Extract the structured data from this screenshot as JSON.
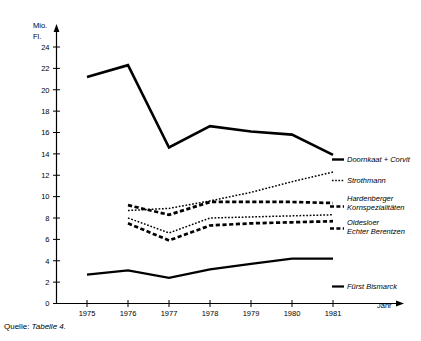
{
  "chart_data": {
    "type": "line",
    "title": "",
    "subtitle": "",
    "xlabel": "Jahr",
    "ylabel": "Mio. Fl.",
    "ylabel_line1": "Mio.",
    "ylabel_line2": "Fl.",
    "x": [
      1975,
      1976,
      1977,
      1978,
      1979,
      1980,
      1981
    ],
    "categories": [
      "1975",
      "1976",
      "1977",
      "1978",
      "1979",
      "1980",
      "1981"
    ],
    "xlim": [
      1974.4,
      1981.9
    ],
    "ylim": [
      0,
      24
    ],
    "yticks": [
      0,
      2,
      4,
      6,
      8,
      10,
      12,
      14,
      16,
      18,
      20,
      22,
      24
    ],
    "ytick_labels": [
      "0",
      "2",
      "4",
      "6",
      "8",
      "10",
      "12",
      "14",
      "16",
      "18",
      "20",
      "22",
      "24"
    ],
    "grid": false,
    "legend_position": "right-inline",
    "series": [
      {
        "name": "Doornkaat + Corvit",
        "style": "solid-thick",
        "x": [
          1975,
          1976,
          1977,
          1978,
          1979,
          1980,
          1981
        ],
        "values": [
          21.2,
          22.3,
          14.6,
          16.6,
          16.1,
          15.8,
          13.9
        ]
      },
      {
        "name": "Strothmann",
        "style": "dotted",
        "x": [
          1976,
          1977,
          1978,
          1979,
          1980,
          1981
        ],
        "values": [
          8.7,
          8.9,
          9.6,
          10.4,
          11.4,
          12.3
        ]
      },
      {
        "name": "Hardenberger Kornspezialitäten",
        "name_line1": "Hardenberger",
        "name_line2": "Kornspezialitäten",
        "style": "dashed-thick",
        "x": [
          1976,
          1977,
          1978,
          1979,
          1980,
          1981
        ],
        "values": [
          9.2,
          8.3,
          9.5,
          9.5,
          9.5,
          9.4
        ]
      },
      {
        "name": "Oldesloer",
        "style": "dotted",
        "x": [
          1976,
          1977,
          1978,
          1979,
          1980,
          1981
        ],
        "values": [
          8.0,
          6.6,
          8.0,
          8.1,
          8.2,
          8.3
        ]
      },
      {
        "name": "Echter Berentzen",
        "style": "dashed-thick",
        "x": [
          1976,
          1977,
          1978,
          1979,
          1980,
          1981
        ],
        "values": [
          7.5,
          5.9,
          7.3,
          7.5,
          7.6,
          7.7
        ]
      },
      {
        "name": "Fürst Bismarck",
        "style": "solid",
        "x": [
          1975,
          1976,
          1977,
          1978,
          1979,
          1980,
          1981
        ],
        "values": [
          2.7,
          3.1,
          2.4,
          3.2,
          3.7,
          4.2,
          4.2
        ]
      }
    ],
    "annotations": [
      {
        "id": "doornkaat",
        "text": "Doornkaat + Corvit"
      },
      {
        "id": "strothmann",
        "text": "Strothmann"
      },
      {
        "id": "hardenberger",
        "text": "Hardenberger"
      },
      {
        "id": "hardenberger2",
        "text": "Kornspezialitäten"
      },
      {
        "id": "oldesloer",
        "text": "Oldesloer"
      },
      {
        "id": "berentzen",
        "text": "Echter Berentzen"
      },
      {
        "id": "bismarck",
        "text": "Fürst Bismarck"
      }
    ]
  },
  "source": {
    "prefix": "Quelle:",
    "reference": "Tabelle 4."
  },
  "colors": {
    "ink": "#000000",
    "background": "#ffffff"
  }
}
